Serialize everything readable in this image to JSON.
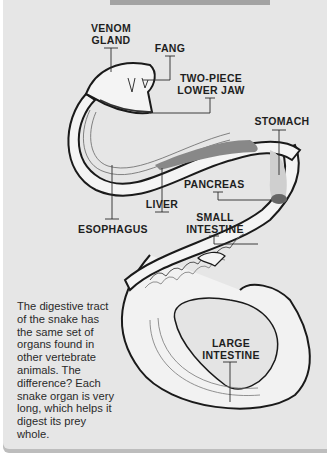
{
  "diagram": {
    "title_bar_color": "#a3a3a3",
    "background_color": "#e6e6e6",
    "labels": {
      "venom_gland": "VENOM\nGLAND",
      "fang": "FANG",
      "lower_jaw": "TWO-PIECE\nLOWER JAW",
      "stomach": "STOMACH",
      "pancreas": "PANCREAS",
      "liver": "LIVER",
      "esophagus": "ESOPHAGUS",
      "small_intestine": "SMALL\nINTESTINE",
      "large_intestine": "LARGE\nINTESTINE"
    },
    "caption": "The digestive tract of the snake has the same set of organs found in other vertebrate animals. The difference? Each snake organ is very long, which helps it digest its prey whole."
  }
}
